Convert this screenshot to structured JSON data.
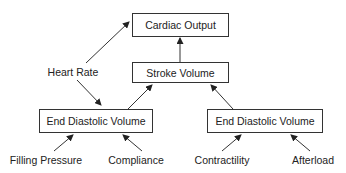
{
  "diagram": {
    "nodes": {
      "cardiac_output": "Cardiac Output",
      "stroke_volume": "Stroke Volume",
      "heart_rate": "Heart Rate",
      "edv_left": "End Diastolic Volume",
      "edv_right": "End Diastolic Volume",
      "filling_pressure": "Filling Pressure",
      "compliance": "Compliance",
      "contractility": "Contractility",
      "afterload": "Afterload"
    },
    "edges": [
      {
        "from": "Heart Rate",
        "to": "Cardiac Output"
      },
      {
        "from": "Stroke Volume",
        "to": "Cardiac Output"
      },
      {
        "from": "Heart Rate",
        "to": "End Diastolic Volume (left)"
      },
      {
        "from": "End Diastolic Volume (left)",
        "to": "Stroke Volume"
      },
      {
        "from": "End Diastolic Volume (right)",
        "to": "Stroke Volume"
      },
      {
        "from": "Filling Pressure",
        "to": "End Diastolic Volume (left)"
      },
      {
        "from": "Compliance",
        "to": "End Diastolic Volume (left)"
      },
      {
        "from": "Contractility",
        "to": "End Diastolic Volume (right)"
      },
      {
        "from": "Afterload",
        "to": "End Diastolic Volume (right)"
      }
    ],
    "colors": {
      "line": "#333333",
      "text": "#222222",
      "background": "#ffffff"
    }
  }
}
